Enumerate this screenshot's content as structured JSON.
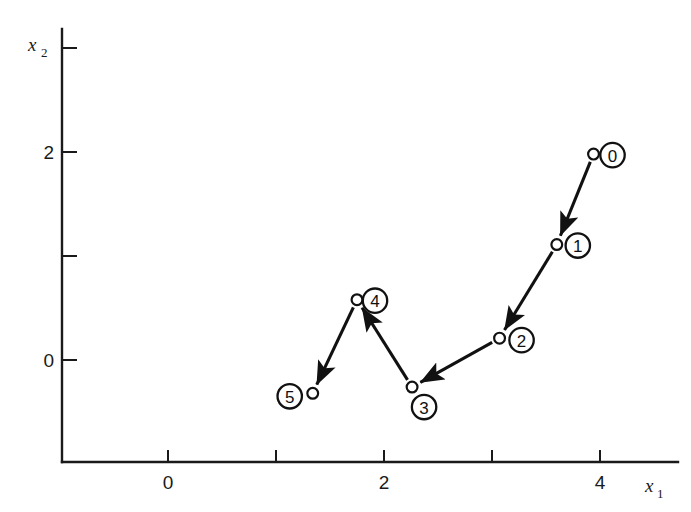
{
  "chart_data": {
    "type": "line",
    "title": "",
    "xlabel": "x1",
    "ylabel": "x2",
    "xlabel_base": "x",
    "xlabel_sub": "1",
    "ylabel_base": "x",
    "ylabel_sub": "2",
    "grid": false,
    "legend": "none",
    "xlim": [
      -0.6,
      4.7
    ],
    "ylim": [
      -0.95,
      3.1
    ],
    "xticks": [
      {
        "value": 0,
        "label": "0"
      },
      {
        "value": 1,
        "label": ""
      },
      {
        "value": 2,
        "label": "2"
      },
      {
        "value": 3,
        "label": ""
      },
      {
        "value": 4,
        "label": "4"
      }
    ],
    "yticks": [
      {
        "value": 0,
        "label": "0"
      },
      {
        "value": 1,
        "label": ""
      },
      {
        "value": 2,
        "label": "2"
      },
      {
        "value": 3,
        "label": ""
      }
    ],
    "series": [
      {
        "name": "iteration-path",
        "marker": "open-circle",
        "arrows": true,
        "points": [
          {
            "label": "0",
            "x": 3.94,
            "y": 1.98,
            "badge_dx": 19,
            "badge_dy": 1
          },
          {
            "label": "1",
            "x": 3.6,
            "y": 1.11,
            "badge_dx": 21,
            "badge_dy": 1
          },
          {
            "label": "2",
            "x": 3.07,
            "y": 0.21,
            "badge_dx": 22,
            "badge_dy": 2
          },
          {
            "label": "3",
            "x": 2.26,
            "y": -0.26,
            "badge_dx": 12,
            "badge_dy": 20
          },
          {
            "label": "4",
            "x": 1.75,
            "y": 0.58,
            "badge_dx": 18,
            "badge_dy": 1
          },
          {
            "label": "5",
            "x": 1.34,
            "y": -0.32,
            "badge_dx": -23,
            "badge_dy": 3
          }
        ]
      }
    ],
    "annotations": [
      {
        "text": "arrows point from point 0 toward point 5 along the search path"
      }
    ]
  }
}
